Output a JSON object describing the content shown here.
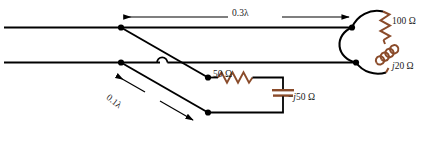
{
  "figure": {
    "type": "circuit-schematic",
    "colors": {
      "wire": "#000000",
      "component": "#8a4b2a",
      "text": "#1a1a1a",
      "background": "#ffffff"
    }
  },
  "labels": {
    "length_main": "0.3λ",
    "length_stub": "0.1λ",
    "antenna_resistance": "100 Ω",
    "antenna_reactance_prefix": "",
    "antenna_reactance_j": "j",
    "antenna_reactance_value": "20 Ω",
    "stub_resistor": "50 Ω",
    "stub_capacitor_prefix": "−",
    "stub_capacitor_j": "j",
    "stub_capacitor_value": "50 Ω"
  },
  "components": [
    {
      "name": "antenna-loop",
      "kind": "loop",
      "label": null
    },
    {
      "name": "antenna-resistor",
      "kind": "resistor",
      "label": "100 Ω"
    },
    {
      "name": "antenna-inductor",
      "kind": "inductor",
      "label": "j20 Ω"
    },
    {
      "name": "stub-resistor",
      "kind": "resistor",
      "label": "50 Ω"
    },
    {
      "name": "stub-capacitor",
      "kind": "capacitor",
      "label": "−j50 Ω"
    }
  ],
  "dimensions": [
    {
      "name": "main-line-length",
      "label": "0.3λ",
      "orientation": "horizontal"
    },
    {
      "name": "stub-length",
      "label": "0.1λ",
      "orientation": "diagonal"
    }
  ]
}
